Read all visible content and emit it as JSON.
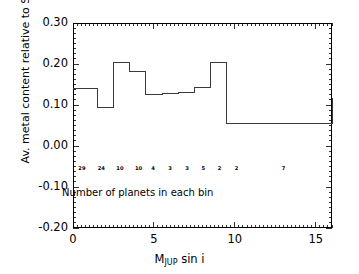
{
  "chart_data": {
    "type": "line",
    "subtype": "step-histogram",
    "title": "",
    "xlabel": "M_JUP sin i",
    "xlabel_parts": {
      "base_pre": "M",
      "sub": "JUP",
      "base_post": " sin i"
    },
    "ylabel": "Av. metal content relative to Sun (dex)",
    "xlim": [
      0,
      16
    ],
    "ylim": [
      -0.2,
      0.3
    ],
    "xticks": [
      0,
      5,
      10,
      15
    ],
    "xtick_labels": [
      "0",
      "5",
      "10",
      "15"
    ],
    "yticks": [
      -0.2,
      -0.1,
      0.0,
      0.1,
      0.2,
      0.3
    ],
    "ytick_labels": [
      "-0.20",
      "-0.10",
      "0.00",
      "0.10",
      "0.20",
      "0.30"
    ],
    "xtick_minor_step": 0.25,
    "ytick_minor_step": 0.0125,
    "grid": false,
    "legend": false,
    "line_color": "#3a3a3a",
    "line_width": 1,
    "bin_edges": [
      0,
      1.5,
      2.5,
      3.5,
      4.5,
      5.5,
      6.5,
      7.5,
      8.5,
      9.5,
      16
    ],
    "values": [
      0.14,
      0.095,
      0.203,
      0.182,
      0.125,
      0.127,
      0.131,
      0.142,
      0.203,
      0.055,
      0.117
    ],
    "bin_counts": [
      29,
      24,
      10,
      10,
      4,
      3,
      3,
      5,
      2,
      2,
      7
    ],
    "bin_count_label_y": -0.057,
    "bin_count_label_x": [
      0.55,
      1.75,
      2.9,
      4.05,
      4.95,
      6.0,
      7.05,
      8.05,
      9.05,
      10.1,
      13.0
    ],
    "annotations": [
      {
        "text": "Number of planets in each bin",
        "x": 4.0,
        "y": -0.115
      }
    ]
  },
  "figure": {
    "background": "#ffffff",
    "frame_color": "#000000"
  }
}
